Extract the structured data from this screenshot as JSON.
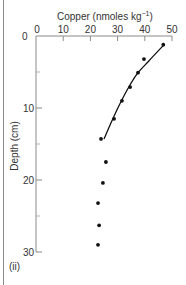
{
  "chart_data": {
    "type": "scatter",
    "xlabel": "Copper (nmoles kg⁻¹)",
    "ylabel": "Depth (cm)",
    "panel_label": "(ii)",
    "x_axis_position": "top",
    "y_axis_inverted": true,
    "xlim": [
      0,
      50
    ],
    "ylim": [
      0,
      30
    ],
    "x_ticks": [
      0,
      10,
      20,
      30,
      40,
      50
    ],
    "y_ticks": [
      0,
      10,
      20,
      30
    ],
    "y_minor_ticks": [
      5,
      15,
      25
    ],
    "grid": false,
    "series": [
      {
        "name": "Observations",
        "kind": "points",
        "points": [
          {
            "x": 46.8,
            "y": 1.2
          },
          {
            "x": 39.7,
            "y": 3.2
          },
          {
            "x": 37.5,
            "y": 5.1
          },
          {
            "x": 34.6,
            "y": 7.1
          },
          {
            "x": 31.6,
            "y": 9.0
          },
          {
            "x": 28.7,
            "y": 11.5
          },
          {
            "x": 23.9,
            "y": 14.3
          },
          {
            "x": 25.7,
            "y": 17.5
          },
          {
            "x": 24.6,
            "y": 20.4
          },
          {
            "x": 22.8,
            "y": 23.2
          },
          {
            "x": 23.2,
            "y": 26.3
          },
          {
            "x": 22.8,
            "y": 29.0
          }
        ]
      },
      {
        "name": "Fitted curve",
        "kind": "line",
        "points": [
          {
            "x": 47.1,
            "y": 1.2
          },
          {
            "x": 41.4,
            "y": 3.5
          },
          {
            "x": 37.1,
            "y": 5.3
          },
          {
            "x": 33.5,
            "y": 7.5
          },
          {
            "x": 30.1,
            "y": 10.0
          },
          {
            "x": 27.2,
            "y": 12.4
          },
          {
            "x": 25.0,
            "y": 14.3
          }
        ]
      }
    ]
  },
  "labels": {
    "title": "Copper (nmoles kg",
    "title_sup": "−1",
    "title_close": ")",
    "ylabel": "Depth (cm)",
    "panel": "(ii)",
    "x_origin": "0",
    "x_ticks": [
      "0",
      "10",
      "20",
      "30",
      "40",
      "50"
    ],
    "y_ticks": [
      "10",
      "20",
      "30"
    ]
  },
  "colors": {
    "axis": "#8a8a8a",
    "text": "#333333",
    "data": "#111111"
  }
}
